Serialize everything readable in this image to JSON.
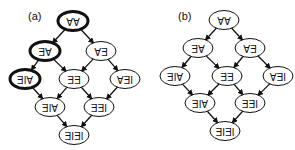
{
  "panels": [
    {
      "label": "(a)",
      "nodes": [
        {
          "id": "a_AA",
          "text": "AA",
          "x": 73,
          "y": 21,
          "bold": true
        },
        {
          "id": "a_AE",
          "text": "AE",
          "x": 45,
          "y": 51,
          "bold": true
        },
        {
          "id": "a_EA",
          "text": "EA",
          "x": 101,
          "y": 51,
          "bold": false
        },
        {
          "id": "a_AIE1",
          "text": "AIE",
          "x": 25,
          "y": 79,
          "bold": true
        },
        {
          "id": "a_EE",
          "text": "EE",
          "x": 74,
          "y": 79,
          "bold": false
        },
        {
          "id": "a_IEA",
          "text": "IEA",
          "x": 125,
          "y": 79,
          "bold": false
        },
        {
          "id": "a_AIE2",
          "text": "AIE",
          "x": 50,
          "y": 107,
          "bold": false
        },
        {
          "id": "a_IEE",
          "text": "IEE",
          "x": 99,
          "y": 107,
          "bold": false
        },
        {
          "id": "a_IEIE",
          "text": "IEIE",
          "x": 74,
          "y": 135,
          "bold": false
        }
      ],
      "edges": [
        [
          "a_AA",
          "a_AE"
        ],
        [
          "a_AA",
          "a_EA"
        ],
        [
          "a_AE",
          "a_AIE1"
        ],
        [
          "a_AE",
          "a_EE"
        ],
        [
          "a_EA",
          "a_EE"
        ],
        [
          "a_EA",
          "a_IEA"
        ],
        [
          "a_AIE1",
          "a_AIE2"
        ],
        [
          "a_EE",
          "a_AIE2"
        ],
        [
          "a_EE",
          "a_IEE"
        ],
        [
          "a_IEA",
          "a_IEE"
        ],
        [
          "a_AIE2",
          "a_IEIE"
        ],
        [
          "a_IEE",
          "a_IEIE"
        ]
      ]
    },
    {
      "label": "(b)",
      "nodes": [
        {
          "id": "b_AA",
          "text": "AA",
          "x": 224,
          "y": 20,
          "bold": false
        },
        {
          "id": "b_AE",
          "text": "AE",
          "x": 198,
          "y": 48,
          "bold": false
        },
        {
          "id": "b_EA",
          "text": "EA",
          "x": 250,
          "y": 48,
          "bold": false
        },
        {
          "id": "b_AIE1",
          "text": "AIE",
          "x": 175,
          "y": 76,
          "bold": false
        },
        {
          "id": "b_EE",
          "text": "EE",
          "x": 227,
          "y": 76,
          "bold": false
        },
        {
          "id": "b_IEA",
          "text": "IEA",
          "x": 278,
          "y": 76,
          "bold": false
        },
        {
          "id": "b_AIE2",
          "text": "AIE",
          "x": 200,
          "y": 103,
          "bold": false
        },
        {
          "id": "b_IEE",
          "text": "IEE",
          "x": 250,
          "y": 103,
          "bold": false
        },
        {
          "id": "b_IEIE",
          "text": "IEIE",
          "x": 225,
          "y": 131,
          "bold": false
        }
      ],
      "edges": [
        [
          "b_AA",
          "b_AE"
        ],
        [
          "b_AA",
          "b_EA"
        ],
        [
          "b_AE",
          "b_AIE1"
        ],
        [
          "b_AE",
          "b_EE"
        ],
        [
          "b_EA",
          "b_EE"
        ],
        [
          "b_EA",
          "b_IEA"
        ],
        [
          "b_AIE1",
          "b_AIE2"
        ],
        [
          "b_EE",
          "b_AIE2"
        ],
        [
          "b_EE",
          "b_IEE"
        ],
        [
          "b_IEA",
          "b_IEE"
        ],
        [
          "b_AIE2",
          "b_IEIE"
        ],
        [
          "b_IEE",
          "b_IEIE"
        ]
      ]
    }
  ],
  "panel_label_positions": [
    {
      "x": 28,
      "y": 20
    },
    {
      "x": 178,
      "y": 20
    }
  ],
  "colors": {
    "stroke": "#111111",
    "background": "#ffffff"
  },
  "text_rotated_180": true
}
